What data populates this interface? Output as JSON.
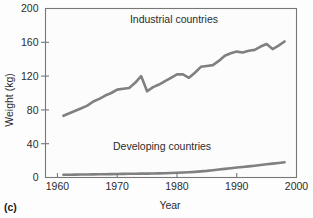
{
  "figure": {
    "panel_label": "(c)",
    "background_color": "#fdfdfd",
    "plot_background_color": "#fcfcfc",
    "frame_color": "#777777"
  },
  "chart_data": {
    "type": "line",
    "title": "",
    "subtitle": "",
    "xlabel": "Year",
    "ylabel": "Weight (kg)",
    "xlim": [
      1958,
      2000
    ],
    "ylim": [
      0,
      200
    ],
    "xticks": [
      1960,
      1970,
      1980,
      1990,
      2000
    ],
    "xtick_labels": [
      "1960",
      "1970",
      "1980",
      "1990",
      "2000"
    ],
    "yticks": [
      0,
      40,
      80,
      120,
      160,
      200
    ],
    "ytick_labels": [
      "0",
      "40",
      "80",
      "120",
      "160",
      "200"
    ],
    "grid": false,
    "legend_position": "inline-annotation",
    "line_color": "#808080",
    "series": [
      {
        "name": "Industrial countries",
        "color": "#808080",
        "annotation": "Industrial countries",
        "annotation_x": 1979.5,
        "annotation_y": 183,
        "x": [
          1961,
          1962,
          1963,
          1964,
          1965,
          1966,
          1967,
          1968,
          1969,
          1970,
          1971,
          1972,
          1973,
          1974,
          1975,
          1976,
          1977,
          1978,
          1979,
          1980,
          1981,
          1982,
          1983,
          1984,
          1985,
          1986,
          1987,
          1988,
          1989,
          1990,
          1991,
          1992,
          1993,
          1994,
          1995,
          1996,
          1997,
          1998
        ],
        "values": [
          73,
          76,
          79,
          82,
          85,
          90,
          93,
          97,
          100,
          104,
          105,
          106,
          112,
          120,
          102,
          107,
          110,
          114,
          118,
          122,
          122,
          118,
          124,
          131,
          132,
          133,
          138,
          144,
          147,
          149,
          148,
          150,
          151,
          155,
          158,
          152,
          156,
          161
        ]
      },
      {
        "name": "Developing countries",
        "color": "#808080",
        "annotation": "Developing countries",
        "annotation_x": 1977.5,
        "annotation_y": 32,
        "x": [
          1961,
          1962,
          1963,
          1964,
          1965,
          1966,
          1967,
          1968,
          1969,
          1970,
          1971,
          1972,
          1973,
          1974,
          1975,
          1976,
          1977,
          1978,
          1979,
          1980,
          1981,
          1982,
          1983,
          1984,
          1985,
          1986,
          1987,
          1988,
          1989,
          1990,
          1991,
          1992,
          1993,
          1994,
          1995,
          1996,
          1997,
          1998
        ],
        "values": [
          3.2,
          3.3,
          3.4,
          3.5,
          3.6,
          3.7,
          3.8,
          3.9,
          4.0,
          4.2,
          4.3,
          4.4,
          4.5,
          4.6,
          4.6,
          4.7,
          4.9,
          5.1,
          5.4,
          5.7,
          6.0,
          6.3,
          6.7,
          7.2,
          7.8,
          8.6,
          9.4,
          10.2,
          11.0,
          11.8,
          12.5,
          13.2,
          14.0,
          14.8,
          15.6,
          16.4,
          17.2,
          18.0
        ]
      }
    ]
  }
}
